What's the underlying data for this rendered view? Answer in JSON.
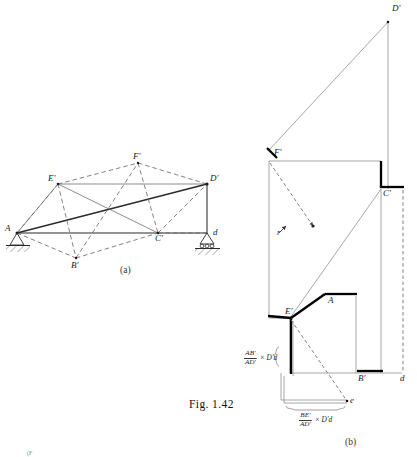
{
  "figure": {
    "caption": "Fig. 1.42",
    "panel_a_tag": "(a)",
    "panel_b_tag": "(b)",
    "bottom_fragment": "(F"
  },
  "colors": {
    "ink": "#1a1a1a",
    "line_thin": "#5a5a5a",
    "line_dashed": "#6b6b6b",
    "line_heavy": "#000000",
    "hatch": "#4a4a4a",
    "background": "#ffffff"
  },
  "panel_a": {
    "name": "williot-mohr-truss-deflected-shape",
    "nodes": [
      {
        "key": "A",
        "label": "A",
        "x": 17,
        "y": 233
      },
      {
        "key": "B1",
        "label": "B'",
        "x": 76,
        "y": 258
      },
      {
        "key": "C1",
        "label": "C'",
        "x": 158,
        "y": 233
      },
      {
        "key": "D1",
        "label": "D'",
        "x": 207,
        "y": 184
      },
      {
        "key": "E1",
        "label": "E'",
        "x": 58,
        "y": 184
      },
      {
        "key": "F1",
        "label": "F'",
        "x": 138,
        "y": 163
      },
      {
        "key": "d",
        "label": "d",
        "x": 207,
        "y": 233
      }
    ],
    "supports": [
      {
        "key": "pin-support-A",
        "type": "pin",
        "x": 17,
        "y": 233
      },
      {
        "key": "roller-support-d",
        "type": "roller",
        "x": 207,
        "y": 233
      }
    ]
  },
  "panel_b": {
    "name": "williot-mohr-displacement-diagram",
    "nodes": [
      {
        "key": "D1",
        "label": "D'",
        "x": 388,
        "y": 12
      },
      {
        "key": "F1",
        "label": "F'",
        "x": 272,
        "y": 152
      },
      {
        "key": "C1",
        "label": "C'",
        "x": 381,
        "y": 189
      },
      {
        "key": "E1",
        "label": "E'",
        "x": 289,
        "y": 318
      },
      {
        "key": "A",
        "label": "A",
        "x": 330,
        "y": 298
      },
      {
        "key": "B1",
        "label": "B'",
        "x": 362,
        "y": 373
      },
      {
        "key": "d",
        "label": "d",
        "x": 402,
        "y": 374
      },
      {
        "key": "e",
        "label": "e",
        "x": 347,
        "y": 403
      },
      {
        "key": "r",
        "label": "r",
        "x": 281,
        "y": 228
      }
    ],
    "expressions": [
      {
        "key": "expr-ab-over-ad",
        "numerator": "AB'",
        "denominator": "AD'",
        "rest": "× D'd",
        "x": 244,
        "y": 355
      },
      {
        "key": "expr-be-over-ad",
        "numerator": "BE'",
        "denominator": "AD'",
        "rest": "× D'd",
        "x": 299,
        "y": 415
      }
    ],
    "brace_labels": {
      "vertical_brace": "⟨",
      "horizontal_brace": "⎵"
    }
  }
}
